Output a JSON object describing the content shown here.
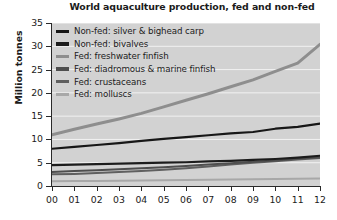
{
  "chart_data": {
    "type": "line",
    "title": "World aquaculture production, fed and non-fed",
    "xlabel": "",
    "ylabel": "Million tonnes",
    "xlim": [
      0,
      12
    ],
    "ylim": [
      0,
      35
    ],
    "grid": true,
    "legend_position": "top-left inside plot",
    "plot_background": "#d2d2d2",
    "gridline_color": "#f2f2f2",
    "x": [
      0,
      1,
      2,
      3,
      4,
      5,
      6,
      7,
      8,
      9,
      10,
      11,
      12
    ],
    "categories": [
      "00",
      "01",
      "02",
      "03",
      "04",
      "05",
      "06",
      "07",
      "08",
      "09",
      "10",
      "11",
      "12"
    ],
    "yticks": [
      0,
      5,
      10,
      15,
      20,
      25,
      30,
      35
    ],
    "ytick_labels": [
      "0",
      "5",
      "10",
      "15",
      "20",
      "25",
      "30",
      "35"
    ],
    "series": [
      {
        "name": "Non-fed: silver & bighead carp",
        "color": "#171717",
        "width": 2.2,
        "values": [
          8.0,
          8.4,
          8.8,
          9.2,
          9.7,
          10.1,
          10.5,
          10.9,
          11.3,
          11.6,
          12.3,
          12.7,
          13.4
        ]
      },
      {
        "name": "Non-fed: bivalves",
        "color": "#1c1c1c",
        "width": 2.2,
        "values": [
          4.5,
          4.6,
          4.7,
          4.8,
          4.9,
          5.0,
          5.1,
          5.3,
          5.4,
          5.6,
          5.8,
          6.1,
          6.5
        ]
      },
      {
        "name": "Fed: freshwater finfish",
        "color": "#8e8e8e",
        "width": 3.0,
        "values": [
          11.0,
          12.2,
          13.3,
          14.4,
          15.6,
          17.0,
          18.4,
          19.8,
          21.3,
          22.8,
          24.6,
          26.4,
          30.4
        ]
      },
      {
        "name": "Fed: diadromous & marine finfish",
        "color": "#4e4e4e",
        "width": 2.0,
        "values": [
          3.0,
          3.2,
          3.4,
          3.6,
          3.8,
          4.0,
          4.3,
          4.6,
          4.9,
          5.2,
          5.5,
          5.9,
          6.2
        ]
      },
      {
        "name": "Fed: crustaceans",
        "color": "#5f5f5f",
        "width": 2.0,
        "values": [
          2.5,
          2.6,
          2.8,
          3.0,
          3.2,
          3.5,
          3.8,
          4.2,
          4.6,
          5.0,
          5.3,
          5.7,
          6.0
        ]
      },
      {
        "name": "Fed: molluscs",
        "color": "#a8a8a8",
        "width": 2.0,
        "values": [
          1.0,
          1.05,
          1.1,
          1.15,
          1.2,
          1.25,
          1.3,
          1.35,
          1.4,
          1.45,
          1.5,
          1.55,
          1.6
        ]
      }
    ]
  },
  "legend": {
    "items": [
      {
        "label": "Non-fed: silver & bighead carp",
        "color": "#171717",
        "thickness": 3.4
      },
      {
        "label": "Non-fed: bivalves",
        "color": "#1c1c1c",
        "thickness": 3.4
      },
      {
        "label": "Fed: freshwater finfish",
        "color": "#8e8e8e",
        "thickness": 3.0
      },
      {
        "label": "Fed: diadromous & marine finfish",
        "color": "#4e4e4e",
        "thickness": 3.2
      },
      {
        "label": "Fed: crustaceans",
        "color": "#5f5f5f",
        "thickness": 3.2
      },
      {
        "label": "Fed: molluscs",
        "color": "#a8a8a8",
        "thickness": 2.6
      }
    ]
  }
}
